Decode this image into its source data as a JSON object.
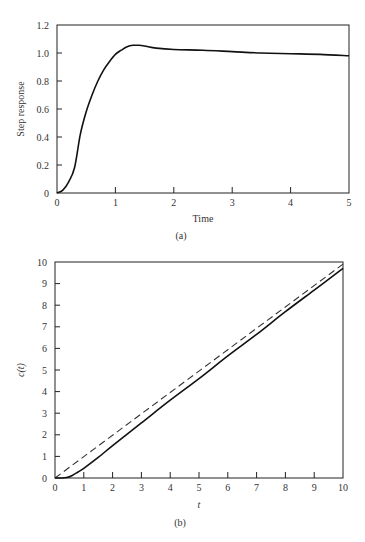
{
  "chart_data": [
    {
      "panel": "(a)",
      "type": "line",
      "title": "",
      "xlabel": "Time",
      "ylabel": "Step response",
      "xlim": [
        0,
        5
      ],
      "ylim": [
        0,
        1.2
      ],
      "xticks": [
        "0",
        "1",
        "2",
        "3",
        "4",
        "5"
      ],
      "yticks": [
        "0",
        "0.2",
        "0.4",
        "0.6",
        "0.8",
        "1.0",
        "1.2"
      ],
      "grid": false,
      "legend": null,
      "series": [
        {
          "name": "step response",
          "style": "solid",
          "x": [
            0,
            0.1,
            0.2,
            0.3,
            0.4,
            0.5,
            0.6,
            0.7,
            0.8,
            0.9,
            1.0,
            1.1,
            1.2,
            1.3,
            1.4,
            1.5,
            1.7,
            2.0,
            2.5,
            3.0,
            3.5,
            4.0,
            4.5,
            5.0
          ],
          "y": [
            0,
            0.02,
            0.08,
            0.18,
            0.42,
            0.58,
            0.7,
            0.8,
            0.88,
            0.94,
            0.99,
            1.02,
            1.045,
            1.055,
            1.055,
            1.05,
            1.035,
            1.025,
            1.02,
            1.01,
            1.0,
            0.995,
            0.99,
            0.98
          ]
        }
      ]
    },
    {
      "panel": "(b)",
      "type": "line",
      "title": "",
      "xlabel": "t",
      "ylabel": "c(t)",
      "xlim": [
        0,
        10
      ],
      "ylim": [
        0,
        10
      ],
      "xticks": [
        "0",
        "1",
        "2",
        "3",
        "4",
        "5",
        "6",
        "7",
        "8",
        "9",
        "10"
      ],
      "yticks": [
        "0",
        "1",
        "2",
        "3",
        "4",
        "5",
        "6",
        "7",
        "8",
        "9",
        "10"
      ],
      "grid": false,
      "legend": null,
      "series": [
        {
          "name": "ramp input",
          "style": "dashed",
          "x": [
            0,
            10
          ],
          "y": [
            0,
            9.9
          ]
        },
        {
          "name": "ramp response",
          "style": "solid",
          "x": [
            0,
            0.2,
            0.4,
            0.6,
            0.8,
            1.0,
            1.5,
            2.0,
            3.0,
            4.0,
            5.0,
            6.0,
            7.0,
            8.0,
            9.0,
            10.0
          ],
          "y": [
            0,
            0.0,
            0.02,
            0.12,
            0.28,
            0.45,
            0.95,
            1.5,
            2.55,
            3.6,
            4.6,
            5.65,
            6.65,
            7.7,
            8.7,
            9.7
          ]
        }
      ]
    }
  ],
  "labels": {
    "a": {
      "xlabel": "Time",
      "ylabel": "Step response",
      "panel": "(a)"
    },
    "b": {
      "xlabel": "t",
      "ylabel": "c(t)",
      "panel": "(b)"
    }
  }
}
